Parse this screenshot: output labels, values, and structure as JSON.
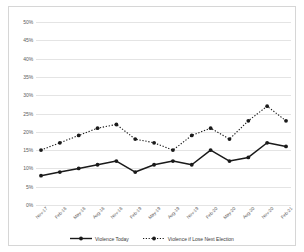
{
  "chart_data": {
    "type": "line",
    "title": "",
    "xlabel": "",
    "ylabel": "",
    "ylim": [
      0,
      50
    ],
    "ytick_step": 5,
    "ytick_labels": [
      "0%",
      "5%",
      "10%",
      "15%",
      "20%",
      "25%",
      "30%",
      "35%",
      "40%",
      "45%",
      "50%"
    ],
    "ytick_values": [
      0,
      5,
      10,
      15,
      20,
      25,
      30,
      35,
      40,
      45,
      50
    ],
    "grid": true,
    "grid_color": "#e4e4e4",
    "legend_position": "bottom",
    "categories": [
      "Nov-17",
      "Feb-18",
      "May-18",
      "Aug-18",
      "Nov-18",
      "Feb-19",
      "May-19",
      "Aug-19",
      "Nov-19",
      "Feb-20",
      "May-20",
      "Aug-20",
      "Nov-20",
      "Feb-21"
    ],
    "series": [
      {
        "name": "Violence Today",
        "style": "solid",
        "color": "#1a1a1a",
        "marker": "circle",
        "values": [
          8,
          9,
          10,
          11,
          12,
          9,
          11,
          12,
          11,
          15,
          12,
          13,
          17,
          16
        ]
      },
      {
        "name": "Violence if Lose Next Election",
        "style": "dotted",
        "color": "#1a1a1a",
        "marker": "circle",
        "values": [
          15,
          17,
          19,
          21,
          22,
          18,
          17,
          15,
          19,
          21,
          18,
          23,
          27,
          23
        ]
      }
    ]
  },
  "legend": {
    "items": [
      {
        "label": "Violence Today"
      },
      {
        "label": "Violence if Lose Next Election"
      }
    ]
  }
}
